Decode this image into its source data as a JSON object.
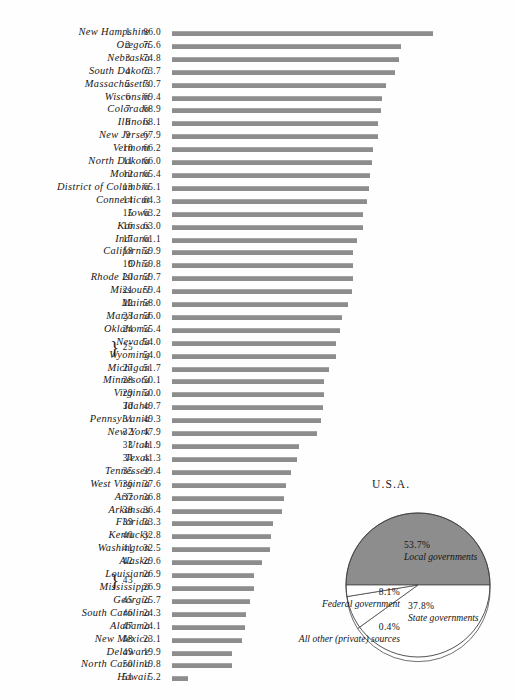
{
  "chart_data": {
    "type": "bar",
    "title": "",
    "xlabel": "",
    "ylabel": "",
    "orientation": "horizontal",
    "grid": false,
    "xlim": [
      0,
      86
    ],
    "columns": [
      "State",
      "Rank",
      "Value"
    ],
    "rows": [
      {
        "name": "New Hampshire",
        "rank": "1",
        "value": "86.0",
        "num": 86.0
      },
      {
        "name": "Oregon",
        "rank": "2",
        "value": "75.6",
        "num": 75.6
      },
      {
        "name": "Nebraska",
        "rank": "3",
        "value": "74.8",
        "num": 74.8
      },
      {
        "name": "South Dakota",
        "rank": "4",
        "value": "73.7",
        "num": 73.7
      },
      {
        "name": "Massachusetts",
        "rank": "5",
        "value": "70.7",
        "num": 70.7
      },
      {
        "name": "Wisconsin",
        "rank": "6",
        "value": "69.4",
        "num": 69.4
      },
      {
        "name": "Colorado",
        "rank": "7",
        "value": "68.9",
        "num": 68.9
      },
      {
        "name": "Illinois",
        "rank": "8",
        "value": "68.1",
        "num": 68.1
      },
      {
        "name": "New Jersey",
        "rank": "9",
        "value": "67.9",
        "num": 67.9
      },
      {
        "name": "Vermont",
        "rank": "10",
        "value": "66.2",
        "num": 66.2
      },
      {
        "name": "North Dakota",
        "rank": "11",
        "value": "66.0",
        "num": 66.0
      },
      {
        "name": "Montana",
        "rank": "12",
        "value": "65.4",
        "num": 65.4
      },
      {
        "name": "District of Columbia",
        "rank": "13",
        "value": "65.1",
        "num": 65.1
      },
      {
        "name": "Connecticut",
        "rank": "14",
        "value": "64.3",
        "num": 64.3
      },
      {
        "name": "Iowa",
        "rank": "15",
        "value": "63.2",
        "num": 63.2
      },
      {
        "name": "Kansas",
        "rank": "16",
        "value": "63.0",
        "num": 63.0
      },
      {
        "name": "Indiana",
        "rank": "17",
        "value": "61.1",
        "num": 61.1
      },
      {
        "name": "California",
        "rank": "18",
        "value": "59.9",
        "num": 59.9
      },
      {
        "name": "Ohio",
        "rank": "19",
        "value": "59.8",
        "num": 59.8
      },
      {
        "name": "Rhode Island",
        "rank": "20",
        "value": "59.7",
        "num": 59.7
      },
      {
        "name": "Missouri",
        "rank": "21",
        "value": "59.4",
        "num": 59.4
      },
      {
        "name": "Maine",
        "rank": "22",
        "value": "58.0",
        "num": 58.0
      },
      {
        "name": "Maryland",
        "rank": "23",
        "value": "56.0",
        "num": 56.0
      },
      {
        "name": "Oklahoma",
        "rank": "24",
        "value": "55.4",
        "num": 55.4
      },
      {
        "name": "Nevada",
        "rank": "25",
        "value": "54.0",
        "num": 54.0,
        "tie": "top"
      },
      {
        "name": "Wyoming",
        "rank": "25",
        "value": "54.0",
        "num": 54.0,
        "tie": "bottom"
      },
      {
        "name": "Michigan",
        "rank": "27",
        "value": "51.7",
        "num": 51.7
      },
      {
        "name": "Minnesota",
        "rank": "28",
        "value": "50.1",
        "num": 50.1
      },
      {
        "name": "Virginia",
        "rank": "29",
        "value": "50.0",
        "num": 50.0
      },
      {
        "name": "Idaho",
        "rank": "30",
        "value": "49.7",
        "num": 49.7
      },
      {
        "name": "Pennsylvania",
        "rank": "31",
        "value": "49.3",
        "num": 49.3
      },
      {
        "name": "New York",
        "rank": "32",
        "value": "47.9",
        "num": 47.9
      },
      {
        "name": "Utah",
        "rank": "33",
        "value": "41.9",
        "num": 41.9
      },
      {
        "name": "Texas",
        "rank": "34",
        "value": "41.3",
        "num": 41.3
      },
      {
        "name": "Tennessee",
        "rank": "35",
        "value": "39.4",
        "num": 39.4
      },
      {
        "name": "West Virginia",
        "rank": "36",
        "value": "37.6",
        "num": 37.6
      },
      {
        "name": "Arizona",
        "rank": "37",
        "value": "36.8",
        "num": 36.8
      },
      {
        "name": "Arkansas",
        "rank": "38",
        "value": "36.4",
        "num": 36.4
      },
      {
        "name": "Florida",
        "rank": "39",
        "value": "33.3",
        "num": 33.3
      },
      {
        "name": "Kentucky",
        "rank": "40",
        "value": "32.8",
        "num": 32.8
      },
      {
        "name": "Washington",
        "rank": "41",
        "value": "32.5",
        "num": 32.5
      },
      {
        "name": "Alaska",
        "rank": "42",
        "value": "29.6",
        "num": 29.6
      },
      {
        "name": "Louisiana",
        "rank": "43",
        "value": "26.9",
        "num": 26.9,
        "tie": "top"
      },
      {
        "name": "Mississippi",
        "rank": "43",
        "value": "26.9",
        "num": 26.9,
        "tie": "bottom"
      },
      {
        "name": "Georgia",
        "rank": "45",
        "value": "25.7",
        "num": 25.7
      },
      {
        "name": "South Carolina",
        "rank": "46",
        "value": "24.3",
        "num": 24.3
      },
      {
        "name": "Alabama",
        "rank": "47",
        "value": "24.1",
        "num": 24.1
      },
      {
        "name": "New Mexico",
        "rank": "48",
        "value": "23.1",
        "num": 23.1
      },
      {
        "name": "Delaware",
        "rank": "49",
        "value": "19.9",
        "num": 19.9
      },
      {
        "name": "North Carolina",
        "rank": "50",
        "value": "19.8",
        "num": 19.8
      },
      {
        "name": "Hawaii",
        "rank": "51",
        "value": "5.2",
        "num": 5.2
      }
    ],
    "bar_color": "#8d8d8d"
  },
  "pie_chart": {
    "type": "pie",
    "title": "U.S.A.",
    "slices": [
      {
        "label": "Local governments",
        "pct_text": "53.7%",
        "value": 53.7,
        "color": "#8d8d8d"
      },
      {
        "label": "State governments",
        "pct_text": "37.8%",
        "value": 37.8,
        "color": "#ffffff"
      },
      {
        "label": "Federal government",
        "pct_text": "8.1%",
        "value": 8.1,
        "color": "#ffffff"
      },
      {
        "label": "All other (private) sources",
        "pct_text": "0.4%",
        "value": 0.4,
        "color": "#ffffff"
      }
    ]
  }
}
